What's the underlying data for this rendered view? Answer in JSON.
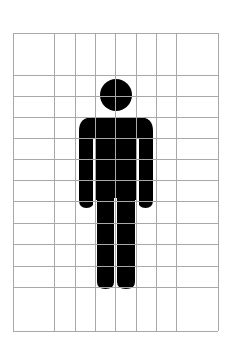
{
  "figure": {
    "fill_color": "#000000",
    "grid_color": "#a8a8a8",
    "background": "#ffffff"
  },
  "grid": {
    "left": 13,
    "right": 218,
    "top": 33,
    "bottom": 331,
    "vertical_lines": [
      13,
      54,
      75,
      95,
      115,
      136,
      156,
      176,
      218
    ],
    "horizontal_lines": [
      33,
      75,
      96,
      117,
      138,
      159,
      180,
      201,
      223,
      244,
      266,
      287,
      331
    ]
  }
}
